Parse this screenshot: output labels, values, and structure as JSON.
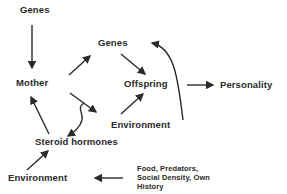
{
  "diagram": {
    "nodes": {
      "genes_top": "Genes",
      "mother": "Mother",
      "genes_mid": "Genes",
      "offspring": "Offspring",
      "personality": "Personality",
      "environment_mid": "Environment",
      "steroid_hormones": "Steroid hormones",
      "environment_bottom": "Environment",
      "food_line1": "Food, Predators,",
      "food_line2": "Social Density, Own",
      "food_line3": "History"
    },
    "edges": [
      {
        "from": "Genes (top)",
        "to": "Mother"
      },
      {
        "from": "Mother",
        "to": "Genes (mid)"
      },
      {
        "from": "Genes (mid)",
        "to": "Offspring"
      },
      {
        "from": "Offspring",
        "to": "Personality"
      },
      {
        "from": "Mother",
        "to": "Environment (mid)"
      },
      {
        "from": "Environment (mid)",
        "to": "Offspring"
      },
      {
        "from": "Environment (mid)",
        "to": "Genes (mid)",
        "style": "curved"
      },
      {
        "from": "Mother-Environment link",
        "to": "Steroid hormones",
        "style": "wavy"
      },
      {
        "from": "Steroid hormones",
        "to": "Mother"
      },
      {
        "from": "Environment (bottom)",
        "to": "Steroid hormones"
      },
      {
        "from": "Food, Predators, Social Density, Own History",
        "to": "Environment (bottom)"
      }
    ],
    "colors": {
      "text": "#2a2a2a",
      "arrow": "#2a2a2a",
      "background": "#ffffff"
    }
  }
}
